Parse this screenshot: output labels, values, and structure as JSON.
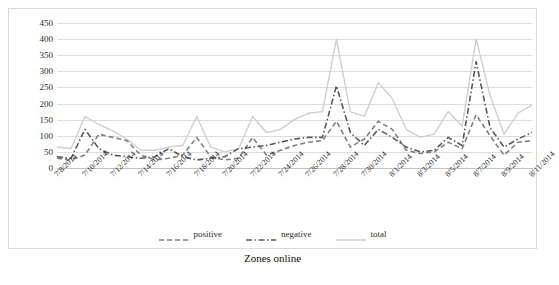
{
  "caption": "Zones online",
  "chart_data": {
    "type": "line",
    "title": "",
    "xlabel": "",
    "ylabel": "",
    "ylim": [
      0,
      450
    ],
    "ytick_step": 50,
    "yticks": [
      450,
      400,
      350,
      300,
      250,
      200,
      150,
      100,
      50,
      0
    ],
    "grid": true,
    "legend_position": "bottom",
    "x": [
      "7/8/2014",
      "7/9/2014",
      "7/10/2014",
      "7/11/2014",
      "7/12/2014",
      "7/13/2014",
      "7/14/2014",
      "7/15/2014",
      "7/16/2014",
      "7/17/2014",
      "7/18/2014",
      "7/19/2014",
      "7/20/2014",
      "7/21/2014",
      "7/22/2014",
      "7/23/2014",
      "7/24/2014",
      "7/25/2014",
      "7/26/2014",
      "7/27/2014",
      "7/28/2014",
      "7/29/2014",
      "7/30/2014",
      "7/31/2014",
      "8/1/2014",
      "8/2/2014",
      "8/3/2014",
      "8/4/2014",
      "8/5/2014",
      "8/6/2014",
      "8/7/2014",
      "8/8/2014",
      "8/9/2014",
      "8/10/2014",
      "8/11/2014"
    ],
    "xtick_labels": [
      "7/8/2014",
      "7/10/2014",
      "7/12/2014",
      "7/14/2014",
      "7/16/2014",
      "7/18/2014",
      "7/20/2014",
      "7/22/2014",
      "7/24/2014",
      "7/26/2014",
      "7/28/2014",
      "7/30/2014",
      "8/1/2014",
      "8/3/2014",
      "8/5/2014",
      "8/7/2014",
      "8/9/2014",
      "8/11/2014"
    ],
    "xtick_indices": [
      0,
      2,
      4,
      6,
      8,
      10,
      12,
      14,
      16,
      18,
      20,
      22,
      24,
      26,
      28,
      30,
      32,
      34
    ],
    "series": [
      {
        "name": "positive",
        "color": "#7f7f7f",
        "style": "dashed",
        "values": [
          30,
          25,
          40,
          105,
          95,
          85,
          40,
          25,
          30,
          40,
          95,
          35,
          25,
          30,
          95,
          40,
          55,
          70,
          80,
          85,
          145,
          65,
          90,
          145,
          120,
          55,
          45,
          50,
          80,
          60,
          165,
          100,
          40,
          80,
          85
        ]
      },
      {
        "name": "negative",
        "color": "#595959",
        "style": "dashdot",
        "values": [
          35,
          30,
          120,
          60,
          40,
          35,
          30,
          35,
          60,
          35,
          25,
          30,
          35,
          60,
          65,
          70,
          80,
          90,
          95,
          95,
          255,
          110,
          70,
          120,
          95,
          65,
          50,
          55,
          95,
          70,
          330,
          125,
          65,
          90,
          110
        ]
      },
      {
        "name": "total",
        "color": "#cfcfcf",
        "style": "solid",
        "values": [
          65,
          60,
          160,
          135,
          115,
          90,
          55,
          55,
          65,
          70,
          160,
          65,
          50,
          60,
          160,
          110,
          120,
          150,
          170,
          175,
          400,
          175,
          160,
          265,
          215,
          120,
          95,
          105,
          175,
          130,
          400,
          225,
          105,
          170,
          195
        ]
      }
    ]
  },
  "legend": [
    {
      "label": "positive",
      "key": "dashed-line-key"
    },
    {
      "label": "negative",
      "key": "dashdot-line-key"
    },
    {
      "label": "total",
      "key": "solid-line-key"
    }
  ]
}
